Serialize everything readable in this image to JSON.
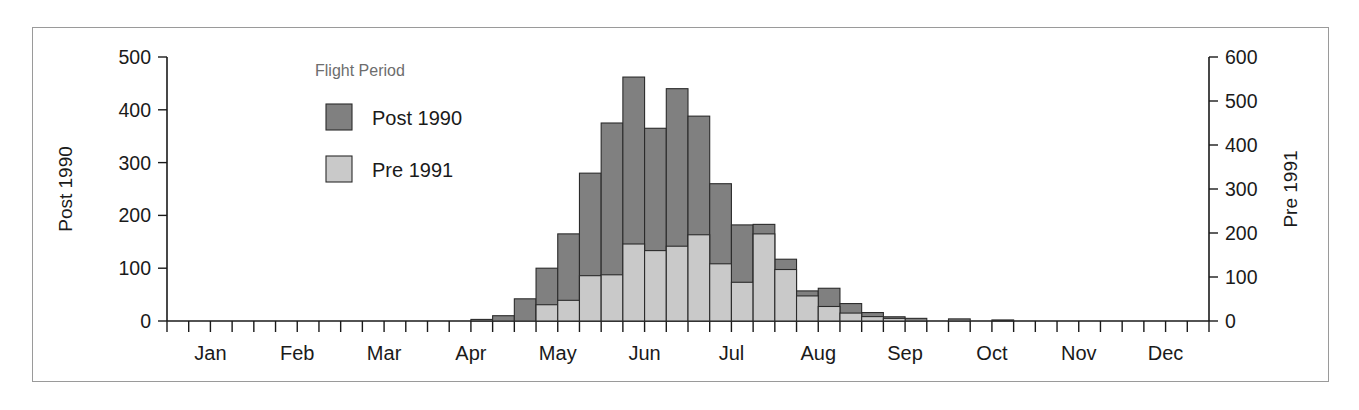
{
  "chart_data": {
    "type": "bar",
    "title": "",
    "subtitle": "",
    "xlabel": "",
    "ylabel": "Post 1990",
    "y2label": "Pre 1991",
    "ylim": [
      0,
      500
    ],
    "y2lim": [
      0,
      600
    ],
    "grid": false,
    "legend_position": "upper-left-inside",
    "legend_title": "Flight Period",
    "bar_style": "overlapping",
    "x_tick_labels": [
      "Jan",
      "Feb",
      "Mar",
      "Apr",
      "May",
      "Jun",
      "Jul",
      "Aug",
      "Sep",
      "Oct",
      "Nov",
      "Dec"
    ],
    "y_tick_labels": [
      "0",
      "100",
      "200",
      "300",
      "400",
      "500"
    ],
    "y_tick_values": [
      0,
      100,
      200,
      300,
      400,
      500
    ],
    "y2_tick_labels": [
      "0",
      "100",
      "200",
      "300",
      "400",
      "500",
      "600"
    ],
    "y2_tick_values": [
      0,
      100,
      200,
      300,
      400,
      500,
      600
    ],
    "x_bin_unit": "week",
    "x_bin_count": 48,
    "categories": [
      "w1",
      "w2",
      "w3",
      "w4",
      "w5",
      "w6",
      "w7",
      "w8",
      "w9",
      "w10",
      "w11",
      "w12",
      "w13",
      "w14",
      "w15",
      "w16",
      "w17",
      "w18",
      "w19",
      "w20",
      "w21",
      "w22",
      "w23",
      "w24",
      "w25",
      "w26",
      "w27",
      "w28",
      "w29",
      "w30",
      "w31",
      "w32",
      "w33",
      "w34",
      "w35",
      "w36",
      "w37",
      "w38",
      "w39",
      "w40",
      "w41",
      "w42",
      "w43",
      "w44",
      "w45",
      "w46",
      "w47",
      "w48"
    ],
    "series": [
      {
        "name": "Post 1990",
        "color": "#808080",
        "axis": "left",
        "values": [
          0,
          0,
          0,
          0,
          0,
          0,
          0,
          0,
          0,
          0,
          0,
          0,
          0,
          0,
          3,
          10,
          42,
          100,
          165,
          280,
          375,
          462,
          365,
          440,
          388,
          260,
          182,
          183,
          117,
          57,
          62,
          33,
          16,
          8,
          5,
          0,
          4,
          0,
          2,
          0,
          0,
          0,
          0,
          0,
          0,
          0,
          0,
          0
        ]
      },
      {
        "name": "Pre 1991",
        "color": "#c9c9c9",
        "axis": "right",
        "values": [
          0,
          0,
          0,
          0,
          0,
          0,
          0,
          0,
          0,
          0,
          0,
          0,
          0,
          0,
          0,
          0,
          0,
          37,
          47,
          103,
          105,
          175,
          160,
          170,
          196,
          130,
          88,
          198,
          117,
          57,
          33,
          18,
          10,
          6,
          0,
          0,
          0,
          0,
          0,
          0,
          0,
          0,
          0,
          0,
          0,
          0,
          0,
          0
        ]
      }
    ]
  },
  "legend": {
    "title": "Flight Period",
    "entries": [
      {
        "label": "Post 1990",
        "color": "#808080",
        "swatch": "dark-gray-square"
      },
      {
        "label": "Pre 1991",
        "color": "#c9c9c9",
        "swatch": "light-gray-square"
      }
    ]
  },
  "axes": {
    "left": {
      "title": "Post 1990",
      "ticks": [
        "500",
        "400",
        "300",
        "200",
        "100",
        "0"
      ]
    },
    "right": {
      "title": "Pre 1991",
      "ticks": [
        "600",
        "500",
        "400",
        "300",
        "200",
        "100",
        "0"
      ]
    },
    "bottom": {
      "months": [
        "Jan",
        "Feb",
        "Mar",
        "Apr",
        "May",
        "Jun",
        "Jul",
        "Aug",
        "Sep",
        "Oct",
        "Nov",
        "Dec"
      ]
    }
  }
}
